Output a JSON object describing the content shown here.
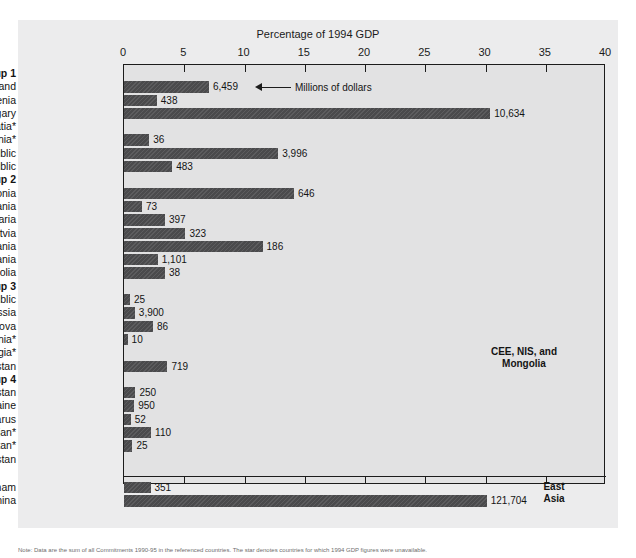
{
  "chart_data": {
    "type": "bar",
    "orientation": "horizontal",
    "title": "",
    "xlabel": "Percentage of 1994 GDP",
    "ylabel": "",
    "xlim": [
      0,
      40
    ],
    "xticks": [
      0,
      5,
      10,
      15,
      20,
      25,
      30,
      35,
      40
    ],
    "grid": false,
    "legend": null,
    "value_label_note": "Millions of dollars",
    "bar_color": "#4a4a4c",
    "panel_color": "#e2e2e3",
    "categories": [
      "Group 1",
      "Poland",
      "Slovenia",
      "Hungary",
      "Croatia*",
      "FYR Macedonia*",
      "Czech Republic",
      "Slovak Republic",
      "Group 2",
      "Estonia",
      "Lithuania",
      "Bulgaria",
      "Latvia",
      "Albania",
      "Romania",
      "Mongolia",
      "Group 3",
      "Kyrgyz Republic",
      "Russia",
      "Moldova",
      "Armenia*",
      "Georgia*",
      "Kazakstan",
      "Group 4",
      "Uzbekistan",
      "Ukraine",
      "Belarus",
      "Azerbaijan*",
      "Tajikistan*",
      "Turkmenistan",
      "Vietnam",
      "China"
    ],
    "rows": [
      {
        "label": "Group 1",
        "is_group": true,
        "percent": null,
        "value": null
      },
      {
        "label": "Poland",
        "is_group": false,
        "percent": 7.05,
        "value": "6,459"
      },
      {
        "label": "Slovenia",
        "is_group": false,
        "percent": 2.72,
        "value": "438"
      },
      {
        "label": "Hungary",
        "is_group": false,
        "percent": 30.4,
        "value": "10,634"
      },
      {
        "label": "Croatia*",
        "is_group": false,
        "percent": 0,
        "value": ""
      },
      {
        "label": "FYR Macedonia*",
        "is_group": false,
        "percent": 2.1,
        "value": "36"
      },
      {
        "label": "Czech Republic",
        "is_group": false,
        "percent": 12.8,
        "value": "3,996"
      },
      {
        "label": "Slovak Republic",
        "is_group": false,
        "percent": 4.0,
        "value": "483"
      },
      {
        "label": "Group 2",
        "is_group": true,
        "percent": null,
        "value": null
      },
      {
        "label": "Estonia",
        "is_group": false,
        "percent": 14.1,
        "value": "646"
      },
      {
        "label": "Lithuania",
        "is_group": false,
        "percent": 1.5,
        "value": "73"
      },
      {
        "label": "Bulgaria",
        "is_group": false,
        "percent": 3.4,
        "value": "397"
      },
      {
        "label": "Latvia",
        "is_group": false,
        "percent": 5.1,
        "value": "323"
      },
      {
        "label": "Albania",
        "is_group": false,
        "percent": 11.5,
        "value": "186"
      },
      {
        "label": "Romania",
        "is_group": false,
        "percent": 2.8,
        "value": "1,101"
      },
      {
        "label": "Mongolia",
        "is_group": false,
        "percent": 3.4,
        "value": "38"
      },
      {
        "label": "Group 3",
        "is_group": true,
        "percent": null,
        "value": null
      },
      {
        "label": "Kyrgyz Republic",
        "is_group": false,
        "percent": 0.5,
        "value": "25"
      },
      {
        "label": "Russia",
        "is_group": false,
        "percent": 0.9,
        "value": "3,900"
      },
      {
        "label": "Moldova",
        "is_group": false,
        "percent": 2.4,
        "value": "86"
      },
      {
        "label": "Armenia*",
        "is_group": false,
        "percent": 0.3,
        "value": "10"
      },
      {
        "label": "Georgia*",
        "is_group": false,
        "percent": 0,
        "value": ""
      },
      {
        "label": "Kazakstan",
        "is_group": false,
        "percent": 3.6,
        "value": "719"
      },
      {
        "label": "Group 4",
        "is_group": true,
        "percent": null,
        "value": null
      },
      {
        "label": "Uzbekistan",
        "is_group": false,
        "percent": 0.95,
        "value": "250"
      },
      {
        "label": "Ukraine",
        "is_group": false,
        "percent": 0.85,
        "value": "950"
      },
      {
        "label": "Belarus",
        "is_group": false,
        "percent": 0.55,
        "value": "52"
      },
      {
        "label": "Azerbaijan*",
        "is_group": false,
        "percent": 2.25,
        "value": "110"
      },
      {
        "label": "Tajikistan*",
        "is_group": false,
        "percent": 0.7,
        "value": "25"
      },
      {
        "label": "Turkmenistan",
        "is_group": false,
        "percent": 0,
        "value": ""
      }
    ],
    "east_asia_rows": [
      {
        "label": "Vietnam",
        "is_group": false,
        "percent": 2.2,
        "value": "351"
      },
      {
        "label": "China",
        "is_group": false,
        "percent": 30.1,
        "value": "121,704"
      }
    ],
    "region_captions": [
      {
        "text": "CEE, NIS, and\nMongolia",
        "line1": "CEE, NIS, and",
        "line2": "Mongolia"
      },
      {
        "text": "East\nAsia",
        "line1": "East",
        "line2": "Asia"
      }
    ]
  },
  "annotation": {
    "callout_label": "Millions of dollars"
  },
  "footnote": {
    "text": "Note: Data are the sum of all Commitments 1990-95 in the referenced countries. The star denotes countries for which 1994 GDP figures were unavailable."
  }
}
